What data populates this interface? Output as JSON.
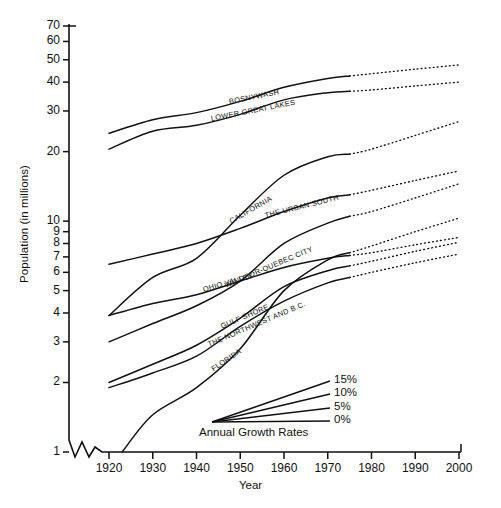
{
  "chart_data": {
    "type": "line",
    "title": "",
    "xlabel": "Year",
    "ylabel": "Population (in millions)",
    "yscale": "log",
    "ylim": [
      1,
      70
    ],
    "xlim": [
      1913,
      2000
    ],
    "grid": false,
    "legend_position": "inside-bottom-right",
    "axis_break": "y-axis break between 1 and 2 at the origin",
    "yticks": [
      1,
      2,
      3,
      4,
      5,
      6,
      7,
      8,
      9,
      10,
      20,
      30,
      40,
      50,
      60,
      70
    ],
    "ytick_labels": [
      "1",
      "2",
      "3",
      "4",
      "5",
      "6",
      "7",
      "8",
      "9",
      "10",
      "20",
      "30",
      "40",
      "50",
      "60",
      "70"
    ],
    "xticks": [
      1920,
      1930,
      1940,
      1950,
      1960,
      1970,
      1980,
      1990,
      2000
    ],
    "xtick_labels": [
      "1920",
      "1930",
      "1940",
      "1950",
      "1960",
      "1970",
      "1980",
      "1990",
      "2000"
    ],
    "solid_end_year": 1975,
    "projection_style": "dotted",
    "series": [
      {
        "name": "BOSNYWASH",
        "label_angle": -11,
        "x": [
          1920,
          1930,
          1940,
          1950,
          1960,
          1970,
          1975,
          1980,
          1990,
          2000
        ],
        "values": [
          24.0,
          27.5,
          29.5,
          33.0,
          38.0,
          41.5,
          42.5,
          43.5,
          45.5,
          47.5
        ]
      },
      {
        "name": "LOWER GREAT LAKES",
        "label_angle": -11,
        "x": [
          1920,
          1930,
          1940,
          1950,
          1960,
          1970,
          1975,
          1980,
          1990,
          2000
        ],
        "values": [
          20.5,
          24.5,
          26.0,
          29.0,
          33.5,
          36.0,
          36.5,
          37.0,
          38.5,
          40.0
        ]
      },
      {
        "name": "CALIFORNIA",
        "label_angle": -30,
        "x": [
          1920,
          1930,
          1940,
          1950,
          1960,
          1970,
          1975,
          1980,
          1990,
          2000
        ],
        "values": [
          3.9,
          5.7,
          6.9,
          10.6,
          15.8,
          19.0,
          19.5,
          20.5,
          23.5,
          27.0
        ]
      },
      {
        "name": "THE URBAN SOUTH",
        "label_angle": -14,
        "x": [
          1920,
          1930,
          1940,
          1950,
          1960,
          1970,
          1975,
          1980,
          1990,
          2000
        ],
        "values": [
          6.5,
          7.2,
          8.0,
          9.3,
          11.0,
          12.6,
          13.0,
          13.6,
          15.0,
          16.5
        ]
      },
      {
        "name": "WINDSOR-QUEBEC CITY",
        "label_angle": -23,
        "x": [
          1920,
          1930,
          1940,
          1950,
          1960,
          1970,
          1975,
          1980,
          1990,
          2000
        ],
        "values": [
          3.0,
          3.6,
          4.3,
          5.5,
          8.0,
          9.8,
          10.5,
          11.0,
          12.6,
          14.5
        ]
      },
      {
        "name": "OHIO VALLEY",
        "label_angle": -16,
        "x": [
          1920,
          1930,
          1940,
          1950,
          1960,
          1970,
          1975,
          1980,
          1990,
          2000
        ],
        "values": [
          3.9,
          4.4,
          4.8,
          5.5,
          6.3,
          6.9,
          7.1,
          7.3,
          7.9,
          8.5
        ]
      },
      {
        "name": "GULF SHORE",
        "label_angle": -23,
        "x": [
          1920,
          1930,
          1940,
          1950,
          1960,
          1970,
          1975,
          1980,
          1990,
          2000
        ],
        "values": [
          2.0,
          2.4,
          2.9,
          3.8,
          5.2,
          6.1,
          6.4,
          6.7,
          7.4,
          8.1
        ]
      },
      {
        "name": "THE NORTHWEST AND B.C.",
        "label_angle": -23,
        "x": [
          1920,
          1930,
          1940,
          1950,
          1960,
          1970,
          1975,
          1980,
          1990,
          2000
        ],
        "values": [
          1.9,
          2.2,
          2.6,
          3.5,
          4.5,
          5.4,
          5.7,
          6.0,
          6.6,
          7.2
        ]
      },
      {
        "name": "FLORIDA",
        "label_angle": -34,
        "x": [
          1923,
          1930,
          1940,
          1950,
          1960,
          1970,
          1975,
          1980,
          1990,
          2000
        ],
        "values": [
          1.0,
          1.45,
          1.9,
          2.8,
          5.0,
          6.8,
          7.3,
          7.8,
          9.0,
          10.3
        ]
      }
    ],
    "legend": {
      "title": "Annual Growth Rates",
      "entries": [
        "15%",
        "10%",
        "5%",
        "0%"
      ]
    }
  }
}
